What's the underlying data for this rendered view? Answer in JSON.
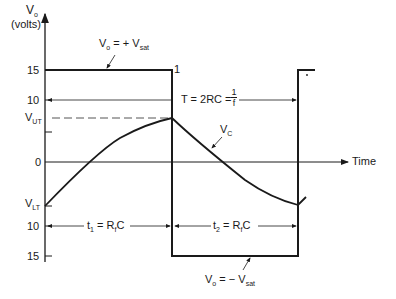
{
  "figure": {
    "y_axis": {
      "label_symbol": "V",
      "label_sub": "o",
      "label_units": "(volts)",
      "ticks": [
        {
          "label": "15",
          "level": "+15"
        },
        {
          "label": "10",
          "level": "+10"
        },
        {
          "label_symbol": "V",
          "label_sub": "UT",
          "level": "V_UT"
        },
        {
          "label": "0",
          "level": "0"
        },
        {
          "label_symbol": "V",
          "label_sub": "LT",
          "level": "V_LT"
        },
        {
          "label": "10",
          "level": "-10"
        },
        {
          "label": "15",
          "level": "-15"
        }
      ]
    },
    "x_axis": {
      "label": "Time"
    },
    "annotations": {
      "vo_pos": {
        "lhs": "V",
        "lhs_sub": "o",
        "eq": " = + ",
        "rhs": "V",
        "rhs_sub": "sat"
      },
      "vo_neg": {
        "lhs": "V",
        "lhs_sub": "o",
        "eq": " = − ",
        "rhs": "V",
        "rhs_sub": "sat"
      },
      "period": {
        "text": "T = 2RC = ",
        "frac_num": "1",
        "frac_den": "f"
      },
      "vc": {
        "symbol": "V",
        "sub": "C"
      },
      "t1": {
        "t": "t",
        "t_sub": "1",
        "eq": " = R",
        "r_sub": "f",
        "c": "C"
      },
      "t2": {
        "t": "t",
        "t_sub": "2",
        "eq": " = R",
        "r_sub": "f",
        "c": "C"
      },
      "corner_mark": "1"
    },
    "colors": {
      "ink": "#1a1a1a",
      "background": "#ffffff",
      "dashed": "#555555"
    }
  }
}
